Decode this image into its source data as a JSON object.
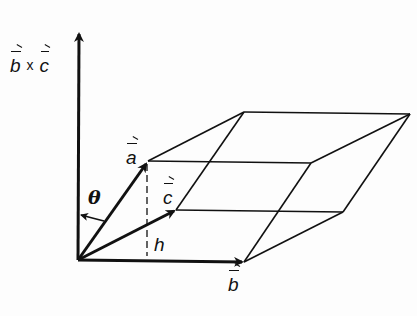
{
  "diagram": {
    "type": "parallelepiped-vector-diagram",
    "stroke_color": "#111111",
    "background": "#fdfdfd",
    "labels": {
      "cross_b": "b",
      "cross_times": "x",
      "cross_c": "c",
      "a": "a",
      "b": "b",
      "c": "c",
      "theta": "θ",
      "h": "h"
    },
    "vertices": {
      "origin": [
        78,
        260
      ],
      "a": [
        148,
        161
      ],
      "b": [
        244,
        262
      ],
      "c": [
        176,
        210
      ],
      "a_plus_b": [
        311,
        163
      ],
      "a_plus_c": [
        244,
        112
      ],
      "b_plus_c": [
        343,
        212
      ],
      "a_plus_b_plus_c": [
        410,
        114
      ],
      "cross_axis_tip": [
        79,
        31
      ]
    }
  }
}
